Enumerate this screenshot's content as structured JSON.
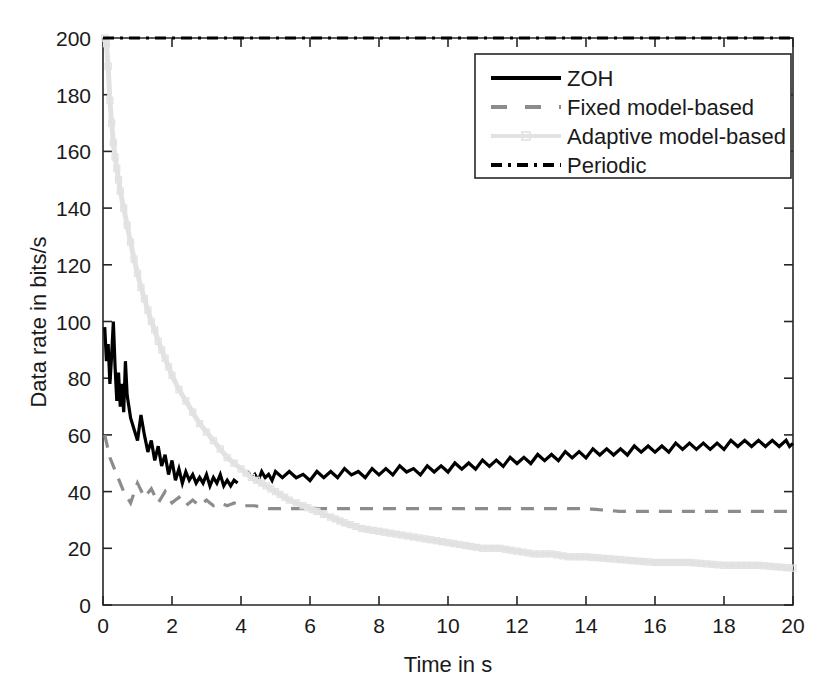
{
  "chart_data": {
    "type": "line",
    "title": "",
    "xlabel": "Time in s",
    "ylabel": "Data rate in bits/s",
    "xlim": [
      0,
      20
    ],
    "ylim": [
      0,
      200
    ],
    "xticks": [
      0,
      2,
      4,
      6,
      8,
      10,
      12,
      14,
      16,
      18,
      20
    ],
    "yticks": [
      0,
      20,
      40,
      60,
      80,
      100,
      120,
      140,
      160,
      180,
      200
    ],
    "xtick_labels": [
      "0",
      "2",
      "4",
      "6",
      "8",
      "10",
      "12",
      "14",
      "16",
      "18",
      "20"
    ],
    "ytick_labels": [
      "0",
      "20",
      "40",
      "60",
      "80",
      "100",
      "120",
      "140",
      "160",
      "180",
      "200"
    ],
    "grid": false,
    "legend_position": "upper right",
    "series": [
      {
        "name": "ZOH",
        "style": "solid",
        "color": "#000000",
        "linewidth": 3.2,
        "x": [
          0.05,
          0.1,
          0.15,
          0.2,
          0.25,
          0.3,
          0.35,
          0.4,
          0.45,
          0.5,
          0.55,
          0.6,
          0.65,
          0.7,
          0.75,
          0.8,
          0.9,
          1.0,
          1.1,
          1.2,
          1.3,
          1.4,
          1.5,
          1.6,
          1.7,
          1.8,
          1.9,
          2.0,
          2.1,
          2.2,
          2.3,
          2.4,
          2.5,
          2.6,
          2.7,
          2.8,
          2.9,
          3.0,
          3.1,
          3.2,
          3.3,
          3.4,
          3.5,
          3.6,
          3.7,
          3.8,
          3.9,
          4.2,
          4.4,
          4.6,
          4.8,
          5.0,
          5.4,
          5.8,
          6.2,
          6.6,
          7.0,
          7.4,
          7.8,
          8.2,
          8.6,
          9.0,
          9.4,
          9.8,
          10.2,
          10.6,
          11.0,
          11.4,
          11.8,
          12.2,
          12.6,
          13.0,
          13.4,
          13.8,
          14.2,
          14.6,
          15.0,
          15.4,
          15.8,
          16.2,
          16.6,
          17.0,
          17.4,
          17.8,
          18.2,
          18.6,
          19.0,
          19.4,
          19.8,
          20.0
        ],
        "y": [
          98,
          86,
          92,
          78,
          88,
          100,
          84,
          72,
          82,
          70,
          78,
          68,
          86,
          74,
          70,
          66,
          62,
          58,
          67,
          60,
          54,
          58,
          51,
          56,
          49,
          53,
          46,
          51,
          44,
          48,
          43,
          47,
          44,
          46,
          43,
          45,
          43,
          46,
          42,
          45,
          43,
          46,
          42,
          44,
          42,
          44,
          43,
          46,
          45,
          46,
          45,
          46,
          46,
          45,
          46,
          46,
          47,
          46,
          47,
          47,
          48,
          47,
          48,
          48,
          49,
          49,
          50,
          50,
          51,
          51,
          52,
          52,
          53,
          53,
          54,
          54,
          54,
          55,
          55,
          55,
          56,
          56,
          56,
          56,
          57,
          57,
          57,
          57,
          57,
          57
        ]
      },
      {
        "name": "Fixed model-based",
        "style": "dashed",
        "color": "#8c8c8c",
        "linewidth": 3.2,
        "x": [
          0.05,
          0.2,
          0.4,
          0.6,
          0.8,
          1.0,
          1.2,
          1.4,
          1.6,
          1.8,
          2.0,
          2.2,
          2.4,
          2.6,
          2.8,
          3.0,
          3.2,
          3.4,
          3.6,
          3.8,
          4.0,
          4.4,
          4.8,
          5.2,
          5.6,
          6.0,
          6.5,
          7.0,
          7.5,
          8.0,
          8.5,
          9.0,
          9.5,
          10.0,
          10.5,
          11.0,
          11.5,
          12.0,
          13.0,
          14.0,
          15.0,
          16.0,
          17.0,
          18.0,
          19.0,
          20.0
        ],
        "y": [
          60,
          52,
          46,
          40,
          36,
          43,
          38,
          41,
          36,
          40,
          36,
          38,
          35,
          37,
          35,
          37,
          35,
          36,
          35,
          36,
          35,
          35,
          34,
          34,
          34,
          34,
          34,
          34,
          34,
          34,
          34,
          34,
          34,
          34,
          34,
          34,
          34,
          34,
          34,
          34,
          33,
          33,
          33,
          33,
          33,
          33
        ]
      },
      {
        "name": "Adaptive model-based",
        "style": "marker-line",
        "color": "#e2e2e2",
        "linewidth": 5,
        "x": [
          0.05,
          0.1,
          0.15,
          0.2,
          0.25,
          0.3,
          0.35,
          0.4,
          0.45,
          0.5,
          0.6,
          0.7,
          0.8,
          0.9,
          1.0,
          1.1,
          1.2,
          1.3,
          1.4,
          1.5,
          1.6,
          1.7,
          1.8,
          1.9,
          2.0,
          2.2,
          2.4,
          2.6,
          2.8,
          3.0,
          3.2,
          3.4,
          3.6,
          3.8,
          4.0,
          4.3,
          4.6,
          5.0,
          5.4,
          5.8,
          6.2,
          6.6,
          7.0,
          7.5,
          8.0,
          8.5,
          9.0,
          9.5,
          10.0,
          10.5,
          11.0,
          11.5,
          12.0,
          12.5,
          13.0,
          13.5,
          14.0,
          15.0,
          16.0,
          17.0,
          18.0,
          19.0,
          20.0
        ],
        "y": [
          200,
          198,
          190,
          178,
          170,
          163,
          158,
          154,
          150,
          146,
          140,
          134,
          128,
          122,
          117,
          112,
          108,
          104,
          100,
          97,
          93,
          90,
          87,
          84,
          81,
          76,
          72,
          68,
          64,
          61,
          58,
          55,
          52,
          50,
          48,
          45,
          43,
          40,
          37,
          35,
          33,
          31,
          29,
          27,
          26,
          25,
          24,
          23,
          22,
          21,
          20,
          20,
          19,
          18,
          18,
          17,
          17,
          16,
          15,
          15,
          14,
          14,
          13
        ]
      },
      {
        "name": "Periodic",
        "style": "dashdot",
        "color": "#000000",
        "linewidth": 3.2,
        "x": [
          0,
          20
        ],
        "y": [
          200,
          200
        ]
      }
    ],
    "legend": [
      {
        "label": "ZOH",
        "style": "solid",
        "color": "#000000"
      },
      {
        "label": "Fixed model-based",
        "style": "dashed",
        "color": "#8c8c8c"
      },
      {
        "label": "Adaptive model-based",
        "style": "marker-line",
        "color": "#e2e2e2"
      },
      {
        "label": "Periodic",
        "style": "dashdot",
        "color": "#000000"
      }
    ]
  }
}
